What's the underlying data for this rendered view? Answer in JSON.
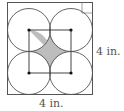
{
  "diagram": {
    "title": "",
    "square": {
      "x": 7,
      "y": 2,
      "size": 86,
      "stroke": "#555555"
    },
    "circles": [
      {
        "cx": 28.5,
        "cy": 23.5,
        "r": 21.5
      },
      {
        "cx": 71.5,
        "cy": 23.5,
        "r": 21.5
      },
      {
        "cx": 28.5,
        "cy": 73.5,
        "r": 21.5
      },
      {
        "cx": 71.5,
        "cy": 73.5,
        "r": 21.5
      }
    ],
    "centers": [
      {
        "x": 29,
        "y": 30
      },
      {
        "x": 71,
        "y": 30
      },
      {
        "x": 29,
        "y": 73
      },
      {
        "x": 71,
        "y": 73
      }
    ],
    "shaded_color": "#bdbdbd",
    "line_color": "#555555",
    "right_label": "4 in.",
    "bottom_label": "4 in.",
    "right_angle_marker": true
  }
}
